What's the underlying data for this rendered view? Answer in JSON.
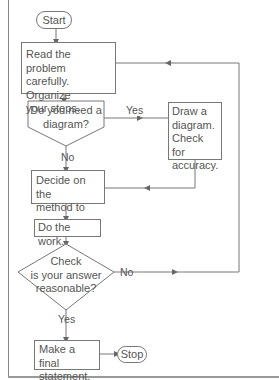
{
  "diagram": {
    "type": "flowchart",
    "top_fragment": "...",
    "nodes": {
      "start": {
        "label": "Start",
        "shape": "terminator"
      },
      "read": {
        "label_lines": [
          "Read the problem",
          "carefully. Organize",
          "your steps."
        ],
        "shape": "process"
      },
      "need_diagram": {
        "label_lines": [
          "Do you need a",
          "diagram?"
        ],
        "shape": "decision"
      },
      "draw": {
        "label_lines": [
          "Draw a",
          "diagram.",
          "Check for",
          "accuracy."
        ],
        "shape": "process"
      },
      "decide": {
        "label_lines": [
          "Decide on the",
          "method to use."
        ],
        "shape": "process"
      },
      "work": {
        "label": "Do the work.",
        "shape": "process"
      },
      "check": {
        "label_lines": [
          "Check",
          "is your answer",
          "reasonable?"
        ],
        "shape": "decision"
      },
      "final": {
        "label_lines": [
          "Make a final",
          "statement."
        ],
        "shape": "process"
      },
      "stop": {
        "label": "Stop",
        "shape": "terminator"
      }
    },
    "edge_labels": {
      "yes1": "Yes",
      "no1": "No",
      "no2": "No",
      "yes2": "Yes"
    },
    "edges": [
      {
        "from": "start",
        "to": "read"
      },
      {
        "from": "read",
        "to": "need_diagram"
      },
      {
        "from": "need_diagram",
        "to": "draw",
        "label": "Yes"
      },
      {
        "from": "need_diagram",
        "to": "decide",
        "label": "No"
      },
      {
        "from": "draw",
        "to": "decide"
      },
      {
        "from": "decide",
        "to": "work"
      },
      {
        "from": "work",
        "to": "check"
      },
      {
        "from": "check",
        "to": "read",
        "label": "No"
      },
      {
        "from": "check",
        "to": "final",
        "label": "Yes"
      },
      {
        "from": "final",
        "to": "stop"
      }
    ],
    "colors": {
      "line": "#777777",
      "text": "#555555",
      "background": "#ffffff"
    }
  }
}
